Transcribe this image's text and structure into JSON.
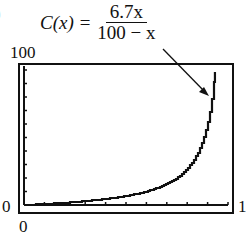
{
  "chart_data": {
    "type": "line",
    "formula": {
      "lhs": "C(x) =",
      "numerator": "6.7x",
      "denominator": "100 − x"
    },
    "xlabel": "",
    "ylabel": "",
    "xlim": [
      0,
      100
    ],
    "ylim": [
      0,
      100
    ],
    "x_tick_labels": {
      "min": "0",
      "max": "1"
    },
    "y_tick_labels": {
      "min": "0",
      "max": "100"
    },
    "x_ticks_count": 10,
    "y_ticks_count": 10,
    "grid": false,
    "legend": null,
    "annotation": "arrow pointing from formula to curve near vertical asymptote",
    "x": [
      0,
      10,
      20,
      30,
      40,
      50,
      60,
      70,
      80,
      85,
      90,
      92,
      93.5
    ],
    "y": [
      0,
      0.74,
      1.68,
      2.87,
      4.47,
      6.7,
      10.05,
      15.63,
      26.8,
      37.97,
      60.3,
      77.05,
      96.38
    ]
  },
  "labels": {
    "ymax": "100",
    "ymin": "0",
    "xmin": "0",
    "xmax": "1",
    "paren": ")"
  }
}
